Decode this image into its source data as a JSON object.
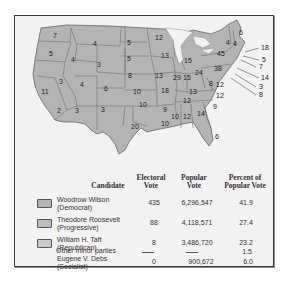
{
  "map": {
    "title": "Election of 1912",
    "fill_color": "#b4b4b4",
    "border_color": "#666666",
    "state_labels": [
      {
        "state": "WA",
        "votes": "7"
      },
      {
        "state": "OR",
        "votes": "5"
      },
      {
        "state": "CA",
        "votes": "11"
      },
      {
        "state": "CA-south",
        "votes": "2"
      },
      {
        "state": "ID",
        "votes": "4"
      },
      {
        "state": "NV",
        "votes": "3"
      },
      {
        "state": "MT",
        "votes": "4"
      },
      {
        "state": "WY",
        "votes": "3"
      },
      {
        "state": "UT",
        "votes": "4"
      },
      {
        "state": "AZ",
        "votes": "3"
      },
      {
        "state": "CO",
        "votes": "6"
      },
      {
        "state": "NM",
        "votes": "3"
      },
      {
        "state": "ND",
        "votes": "5"
      },
      {
        "state": "SD",
        "votes": "5"
      },
      {
        "state": "NE",
        "votes": "8"
      },
      {
        "state": "KS",
        "votes": "10"
      },
      {
        "state": "OK",
        "votes": "10"
      },
      {
        "state": "TX",
        "votes": "20"
      },
      {
        "state": "MN",
        "votes": "12"
      },
      {
        "state": "IA",
        "votes": "13"
      },
      {
        "state": "MO",
        "votes": "18"
      },
      {
        "state": "AR",
        "votes": "9"
      },
      {
        "state": "LA",
        "votes": "10"
      },
      {
        "state": "WI",
        "votes": "13"
      },
      {
        "state": "IL",
        "votes": "29"
      },
      {
        "state": "MI",
        "votes": "15"
      },
      {
        "state": "IN",
        "votes": "15"
      },
      {
        "state": "OH",
        "votes": "24"
      },
      {
        "state": "KY",
        "votes": "13"
      },
      {
        "state": "TN",
        "votes": "12"
      },
      {
        "state": "MS",
        "votes": "10"
      },
      {
        "state": "AL",
        "votes": "12"
      },
      {
        "state": "GA",
        "votes": "14"
      },
      {
        "state": "FL",
        "votes": "6"
      },
      {
        "state": "SC",
        "votes": "9"
      },
      {
        "state": "NC",
        "votes": "12"
      },
      {
        "state": "VA",
        "votes": "12"
      },
      {
        "state": "WV",
        "votes": "8"
      },
      {
        "state": "PA",
        "votes": "38"
      },
      {
        "state": "NY",
        "votes": "45"
      },
      {
        "state": "VT",
        "votes": "4"
      },
      {
        "state": "NH",
        "votes": "4"
      },
      {
        "state": "ME",
        "votes": "6"
      },
      {
        "state": "MA",
        "votes": "18"
      },
      {
        "state": "RI",
        "votes": "5"
      },
      {
        "state": "CT",
        "votes": "7"
      },
      {
        "state": "NJ",
        "votes": "14"
      },
      {
        "state": "DE",
        "votes": "3"
      },
      {
        "state": "MD",
        "votes": "8"
      }
    ]
  },
  "table": {
    "headers": {
      "candidate": "Candidate",
      "electoral_1": "Electoral",
      "electoral_2": "Vote",
      "popular_1": "Popular",
      "popular_2": "Vote",
      "percent_1": "Percent of",
      "percent_2": "Popular Vote"
    },
    "rows": [
      {
        "name": "Woodrow Wilson",
        "party": "(Democrat)",
        "electoral": "435",
        "popular": "6,296,547",
        "percent": "41.9",
        "swatch": "#b4b4b4"
      },
      {
        "name": "Theodore Roosevelt",
        "party": "(Progressive)",
        "electoral": "88",
        "popular": "4,118,571",
        "percent": "27.4",
        "swatch": "#bdbdbd"
      },
      {
        "name": "William H. Taft",
        "party": "(Republican)",
        "electoral": "8",
        "popular": "3,486,720",
        "percent": "23.2",
        "swatch": "#c8c8c8"
      },
      {
        "name": "Eugene V. Debs",
        "party": "(Socialist)",
        "electoral": "0",
        "popular": "900,672",
        "percent": "6.0"
      },
      {
        "name": "Other minor parties",
        "party": "",
        "electoral": "—",
        "popular": "—",
        "percent": "1.5"
      }
    ]
  }
}
